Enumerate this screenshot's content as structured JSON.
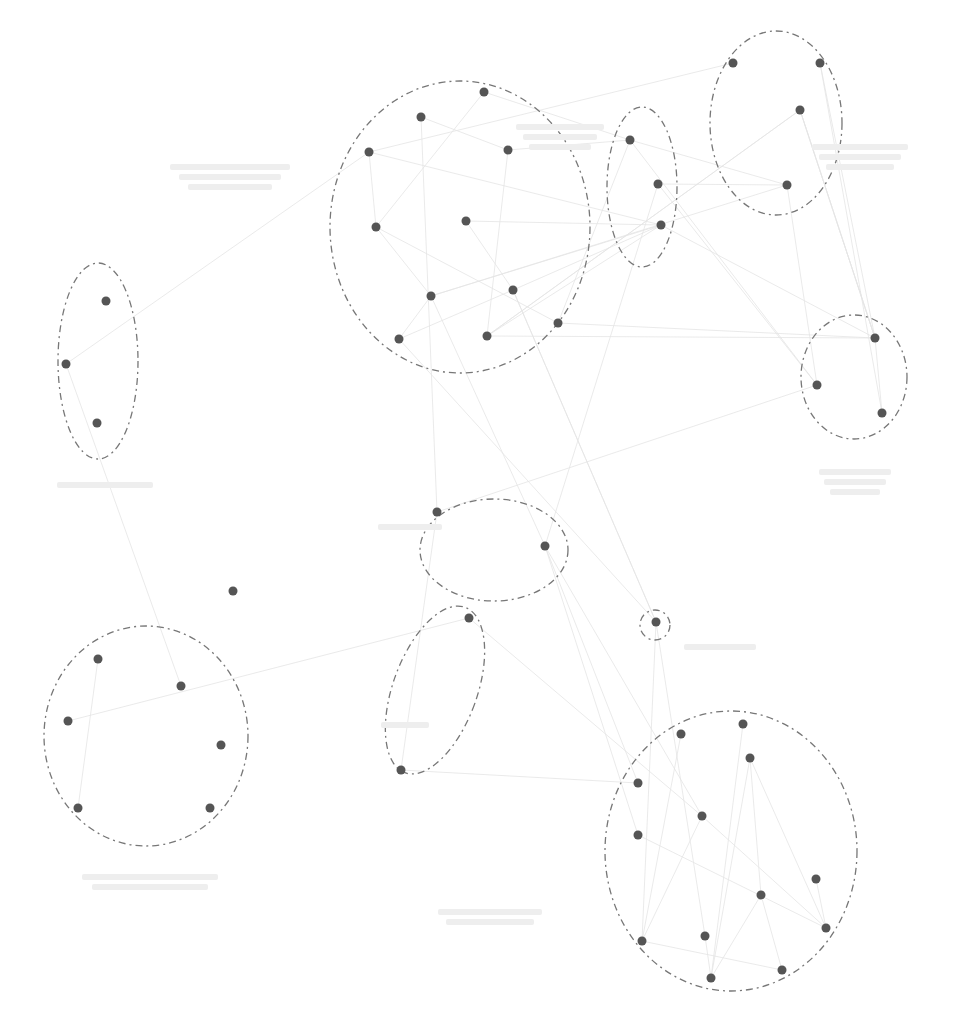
{
  "diagram": {
    "type": "clustered-network",
    "width": 957,
    "height": 1016,
    "colors": {
      "node": "#555555",
      "cluster_outline": "#777777",
      "edge": "#e4e4e4",
      "label": "#eeeeee"
    },
    "clusters": [
      {
        "id": "c1",
        "cx": 460,
        "cy": 227,
        "rx": 130,
        "ry": 146,
        "label_note": "illegible"
      },
      {
        "id": "c2",
        "cx": 642,
        "cy": 187,
        "rx": 35,
        "ry": 80
      },
      {
        "id": "c3",
        "cx": 776,
        "cy": 123,
        "rx": 66,
        "ry": 92
      },
      {
        "id": "c4",
        "cx": 98,
        "cy": 361,
        "rx": 40,
        "ry": 98
      },
      {
        "id": "c5",
        "cx": 854,
        "cy": 377,
        "rx": 53,
        "ry": 62
      },
      {
        "id": "c6",
        "cx": 494,
        "cy": 550,
        "rx": 74,
        "ry": 51
      },
      {
        "id": "c7",
        "cx": 655,
        "cy": 625,
        "rx": 15,
        "ry": 15
      },
      {
        "id": "c8",
        "cx": 435,
        "cy": 690,
        "rx": 42,
        "ry": 88,
        "rotate": 20
      },
      {
        "id": "c9",
        "cx": 146,
        "cy": 736,
        "rx": 102,
        "ry": 110
      },
      {
        "id": "c10",
        "cx": 731,
        "cy": 851,
        "rx": 126,
        "ry": 140
      }
    ],
    "nodes": [
      [
        484,
        92
      ],
      [
        421,
        117
      ],
      [
        369,
        152
      ],
      [
        508,
        150
      ],
      [
        466,
        221
      ],
      [
        376,
        227
      ],
      [
        431,
        296
      ],
      [
        513,
        290
      ],
      [
        558,
        323
      ],
      [
        399,
        339
      ],
      [
        487,
        336
      ],
      [
        630,
        140
      ],
      [
        658,
        184
      ],
      [
        661,
        225
      ],
      [
        733,
        63
      ],
      [
        820,
        63
      ],
      [
        800,
        110
      ],
      [
        787,
        185
      ],
      [
        106,
        301
      ],
      [
        66,
        364
      ],
      [
        97,
        423
      ],
      [
        875,
        338
      ],
      [
        817,
        385
      ],
      [
        882,
        413
      ],
      [
        437,
        512
      ],
      [
        545,
        546
      ],
      [
        656,
        622
      ],
      [
        469,
        618
      ],
      [
        401,
        770
      ],
      [
        98,
        659
      ],
      [
        181,
        686
      ],
      [
        68,
        721
      ],
      [
        221,
        745
      ],
      [
        78,
        808
      ],
      [
        210,
        808
      ],
      [
        681,
        734
      ],
      [
        743,
        724
      ],
      [
        750,
        758
      ],
      [
        638,
        783
      ],
      [
        702,
        816
      ],
      [
        638,
        835
      ],
      [
        816,
        879
      ],
      [
        761,
        895
      ],
      [
        826,
        928
      ],
      [
        642,
        941
      ],
      [
        705,
        936
      ],
      [
        711,
        978
      ],
      [
        782,
        970
      ]
    ],
    "isolated_nodes": [
      [
        233,
        591
      ]
    ],
    "labels": [
      {
        "x": 230,
        "y": 160,
        "lines": 3,
        "width": 150,
        "text": ""
      },
      {
        "x": 560,
        "y": 120,
        "lines": 3,
        "width": 110,
        "text": ""
      },
      {
        "x": 860,
        "y": 140,
        "lines": 3,
        "width": 120,
        "text": ""
      },
      {
        "x": 105,
        "y": 478,
        "lines": 1,
        "width": 120,
        "text": ""
      },
      {
        "x": 855,
        "y": 465,
        "lines": 3,
        "width": 90,
        "text": ""
      },
      {
        "x": 410,
        "y": 520,
        "lines": 1,
        "width": 80,
        "text": ""
      },
      {
        "x": 720,
        "y": 640,
        "lines": 1,
        "width": 90,
        "text": ""
      },
      {
        "x": 405,
        "y": 718,
        "lines": 1,
        "width": 60,
        "text": ""
      },
      {
        "x": 150,
        "y": 870,
        "lines": 2,
        "width": 170,
        "text": ""
      },
      {
        "x": 490,
        "y": 905,
        "lines": 2,
        "width": 130,
        "text": ""
      }
    ]
  }
}
